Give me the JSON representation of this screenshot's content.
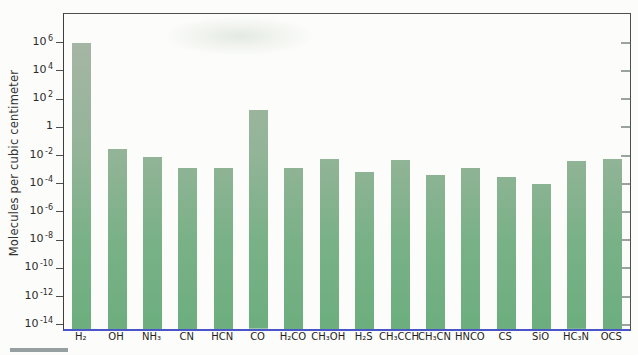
{
  "figure": {
    "ylabel": "Molecules per cubic centimeter",
    "colors": {
      "bar_top": "#aab6a7",
      "bar_mid": "#92b497",
      "bar_bottom": "#6cae7e",
      "frame": "#4e4e4e",
      "baseline": "#4856c8",
      "right_tick": "#9aa49f",
      "text": "#2b2b2b",
      "background": "#fcfcfa"
    }
  },
  "chart_data": {
    "type": "bar",
    "scale": "log",
    "title": "",
    "xlabel": "",
    "ylabel": "Molecules per cubic centimeter",
    "ylim": [
      1e-14,
      1000000.0
    ],
    "y_tick_exponents": [
      6,
      4,
      2,
      0,
      -2,
      -4,
      -6,
      -8,
      -10,
      -12,
      -14
    ],
    "grid": false,
    "legend": "none",
    "categories": [
      "H₂",
      "OH",
      "NH₃",
      "CN",
      "HCN",
      "CO",
      "H₂CO",
      "CH₃OH",
      "H₂S",
      "CH₃CCH",
      "CH₃CN",
      "HNCO",
      "CS",
      "SiO",
      "HC₃N",
      "OCS"
    ],
    "values": [
      1000000,
      0.03,
      0.008,
      0.0014,
      0.0014,
      16,
      0.0014,
      0.006,
      0.0007,
      0.005,
      0.00045,
      0.0014,
      0.0003,
      0.0001,
      0.004,
      0.006
    ]
  }
}
